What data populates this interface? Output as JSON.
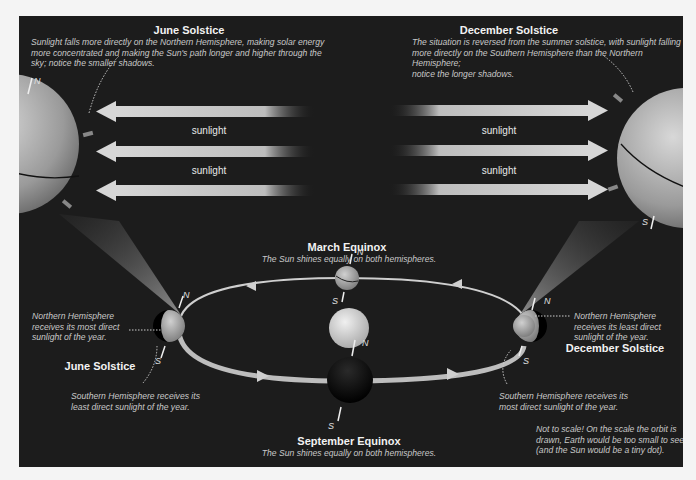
{
  "figure": {
    "background_color": "#f4f4f4",
    "panel_color": "#1c1c1c",
    "sunlight_color": "#cfcfcf"
  },
  "june_header": {
    "title": "June Solstice",
    "description_lines": [
      "Sunlight falls more directly on the Northern Hemisphere, making solar energy",
      "more concentrated and making the Sun's path longer and higher through the",
      "sky; notice the smaller shadows."
    ]
  },
  "december_header": {
    "title": "December Solstice",
    "description_lines": [
      "The situation is reversed from the summer solstice, with sunlight falling",
      "more directly on the Southern Hemisphere than the Northern Hemisphere;",
      "notice the longer shadows."
    ]
  },
  "sunlight_labels": {
    "left": [
      "sunlight",
      "sunlight"
    ],
    "right": [
      "sunlight",
      "sunlight"
    ]
  },
  "poles": {
    "north": "N",
    "south": "S"
  },
  "march_equinox": {
    "title": "March Equinox",
    "description": "The Sun shines equally on both hemispheres."
  },
  "september_equinox": {
    "title": "September Equinox",
    "description": "The Sun shines equally on both hemispheres."
  },
  "june_orbit": {
    "title": "June Solstice",
    "north_note_lines": [
      "Northern Hemisphere",
      "receives its most direct",
      "sunlight of the year."
    ],
    "south_note_lines": [
      "Southern Hemisphere receives its",
      "least direct sunlight of the year."
    ]
  },
  "december_orbit": {
    "title": "December Solstice",
    "north_note_lines": [
      "Northern Hemisphere",
      "receives its least direct",
      "sunlight of the year."
    ],
    "south_note_lines": [
      "Southern Hemisphere receives its",
      "most direct sunlight of the year."
    ]
  },
  "scale_note_lines": [
    "Not to scale! On the scale the orbit is",
    "drawn, Earth would be too small to see",
    "(and the Sun would be a tiny dot)."
  ]
}
